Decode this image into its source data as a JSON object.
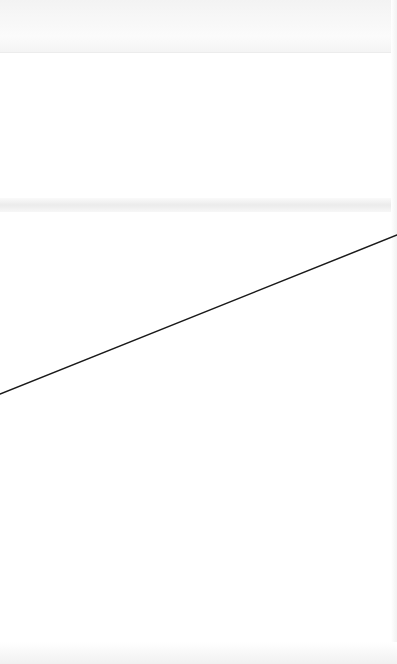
{
  "canvas": {
    "width": 397,
    "height": 664,
    "background": "#ffffff"
  },
  "line": {
    "x1": 0,
    "y1": 394,
    "x2": 397,
    "y2": 235,
    "color": "#1a1a1a",
    "width": 1.5
  }
}
